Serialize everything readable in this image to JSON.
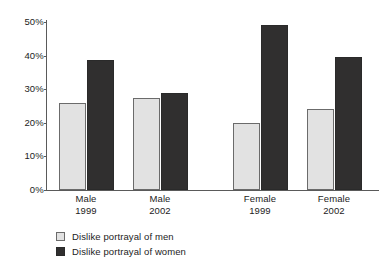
{
  "chart_data": {
    "type": "bar",
    "title": "",
    "subtitle": "",
    "xlabel": "",
    "ylabel": "",
    "categories": [
      "Male 1999",
      "Male 2002",
      "Female 1999",
      "Female 2002"
    ],
    "category_labels": [
      {
        "group": "Male",
        "year": "1999"
      },
      {
        "group": "Male",
        "year": "2002"
      },
      {
        "group": "Female",
        "year": "1999"
      },
      {
        "group": "Female",
        "year": "2002"
      }
    ],
    "series": [
      {
        "name": "Dislike portrayal of men",
        "color": "#e2e2e2",
        "values": [
          26,
          27.5,
          20,
          24
        ]
      },
      {
        "name": "Dislike portrayal of women",
        "color": "#302f2f",
        "values": [
          38.7,
          29,
          49,
          39.5
        ]
      }
    ],
    "ylim": [
      0,
      50
    ],
    "yticks": [
      0,
      10,
      20,
      30,
      40,
      50
    ],
    "ytick_labels": [
      "0%",
      "10%",
      "20%",
      "30%",
      "40%",
      "50%"
    ],
    "grid": false,
    "legend_position": "bottom-left",
    "value_suffix": "%"
  },
  "legend": {
    "items": [
      {
        "label": "Dislike portrayal of men",
        "swatch": "light"
      },
      {
        "label": "Dislike portrayal of women",
        "swatch": "dark"
      }
    ]
  }
}
